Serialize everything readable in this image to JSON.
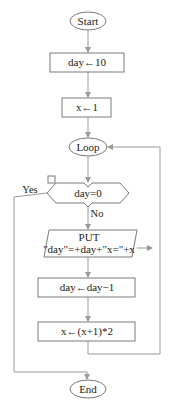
{
  "flowchart": {
    "start": {
      "label": "Start"
    },
    "init_day": {
      "label": "day←10"
    },
    "init_x": {
      "label": "x←1"
    },
    "loop": {
      "label": "Loop"
    },
    "decision": {
      "label": "day=0",
      "yes_label": "Yes",
      "no_label": "No"
    },
    "output": {
      "line1": "PUT",
      "line2": "\"day\"=+day+\"x=\"+x"
    },
    "decrement_day": {
      "label": "day←day−1"
    },
    "update_x": {
      "label": "x←(x+1)*2"
    },
    "end": {
      "label": "End"
    }
  },
  "colors": {
    "shape_stroke": "#7a7a7a",
    "connector": "#9a9a9a",
    "text": "#222222",
    "background": "#ffffff"
  }
}
